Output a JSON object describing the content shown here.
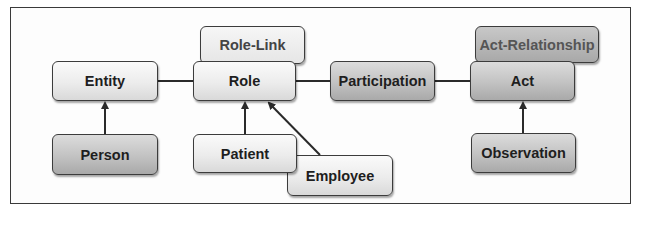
{
  "diagram": {
    "nodes": {
      "role_link": {
        "label": "Role-Link",
        "style": "light"
      },
      "entity": {
        "label": "Entity",
        "style": "light"
      },
      "role": {
        "label": "Role",
        "style": "light"
      },
      "participation": {
        "label": "Participation",
        "style": "dark"
      },
      "act_relationship": {
        "label": "Act-Relationship",
        "style": "dark"
      },
      "act": {
        "label": "Act",
        "style": "dark"
      },
      "person": {
        "label": "Person",
        "style": "dark"
      },
      "patient": {
        "label": "Patient",
        "style": "light"
      },
      "employee": {
        "label": "Employee",
        "style": "light"
      },
      "observation": {
        "label": "Observation",
        "style": "dark"
      }
    },
    "edges": [
      {
        "from": "Entity",
        "to": "Role",
        "type": "association"
      },
      {
        "from": "Role",
        "to": "Participation",
        "type": "association"
      },
      {
        "from": "Participation",
        "to": "Act",
        "type": "association"
      },
      {
        "from": "Person",
        "to": "Entity",
        "type": "generalization"
      },
      {
        "from": "Patient",
        "to": "Role",
        "type": "generalization"
      },
      {
        "from": "Employee",
        "to": "Role",
        "type": "generalization"
      },
      {
        "from": "Observation",
        "to": "Act",
        "type": "generalization"
      }
    ],
    "colors": {
      "light_fill": "#ececec",
      "dark_fill": "#c2c2c2",
      "border": "#3c3c3c",
      "line": "#2a2a2a"
    }
  }
}
